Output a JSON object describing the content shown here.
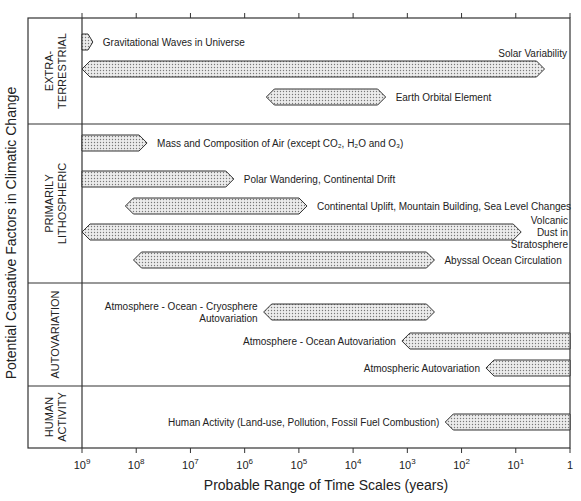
{
  "chart_data": {
    "type": "bar",
    "subtype": "horizontal-range",
    "title": "",
    "xlabel": "Probable Range of Time Scales (years)",
    "ylabel": "Potential Causative Factors in Climatic Change",
    "x_scale": "log",
    "x_direction": "decreasing",
    "xlim_log10": [
      9,
      0
    ],
    "x_ticks": [
      {
        "exp": 9,
        "base": "10",
        "sup": "9"
      },
      {
        "exp": 8,
        "base": "10",
        "sup": "8"
      },
      {
        "exp": 7,
        "base": "10",
        "sup": "7"
      },
      {
        "exp": 6,
        "base": "10",
        "sup": "6"
      },
      {
        "exp": 5,
        "base": "10",
        "sup": "5"
      },
      {
        "exp": 4,
        "base": "10",
        "sup": "4"
      },
      {
        "exp": 3,
        "base": "10",
        "sup": "3"
      },
      {
        "exp": 2,
        "base": "10",
        "sup": "2"
      },
      {
        "exp": 1,
        "base": "10",
        "sup": "1"
      },
      {
        "exp": 0,
        "base": "1",
        "sup": ""
      }
    ],
    "groups": [
      {
        "name": "EXTRA-TERRESTRIAL",
        "label_lines": [
          "EXTRA-",
          "TERRESTRIAL"
        ],
        "rows": 3,
        "factors": [
          {
            "name": "Gravitational Waves in Universe",
            "label_lines": [
              "Gravitational Waves in Universe"
            ],
            "from_log10": 9.0,
            "to_log10": 8.8,
            "label_side": "right"
          },
          {
            "name": "Solar Variability",
            "label_lines": [
              "Solar Variability"
            ],
            "from_log10": 9.0,
            "to_log10": 0.47,
            "label_side": "above-right"
          },
          {
            "name": "Earth Orbital Element",
            "label_lines": [
              "Earth Orbital Element"
            ],
            "from_log10": 5.6,
            "to_log10": 3.4,
            "label_side": "right"
          }
        ]
      },
      {
        "name": "PRIMARILY LITHOSPHERIC",
        "label_lines": [
          "PRIMARILY",
          "LITHOSPHERIC"
        ],
        "rows": 5,
        "factors": [
          {
            "name": "Mass and Composition of Air (except CO2, H2O and O3)",
            "label_lines": [
              "Mass and Composition of Air (except CO₂, H₂O and O₃)"
            ],
            "from_log10": 9.0,
            "to_log10": 7.8,
            "label_side": "right"
          },
          {
            "name": "Polar Wandering, Continental Drift",
            "label_lines": [
              "Polar Wandering, Continental Drift"
            ],
            "from_log10": 9.0,
            "to_log10": 6.2,
            "label_side": "right"
          },
          {
            "name": "Continental Uplift, Mountain Building, Sea Level Changes",
            "label_lines": [
              "Continental Uplift, Mountain Building, Sea Level Changes"
            ],
            "from_log10": 8.2,
            "to_log10": 4.85,
            "label_side": "right"
          },
          {
            "name": "Volcanic Dust in Stratosphere",
            "label_lines": [
              "Volcanic",
              "Dust in",
              "Stratosphere"
            ],
            "from_log10": 9.0,
            "to_log10": 0.9,
            "label_side": "right-edge"
          },
          {
            "name": "Abyssal Ocean Circulation",
            "label_lines": [
              "Abyssal Ocean Circulation"
            ],
            "from_log10": 8.05,
            "to_log10": 2.5,
            "label_side": "right"
          }
        ]
      },
      {
        "name": "AUTOVARIATION",
        "label_lines": [
          "AUTOVARIATION"
        ],
        "rows": 3,
        "factors": [
          {
            "name": "Atmosphere - Ocean - Cryosphere Autovariation",
            "label_lines": [
              "Atmosphere - Ocean - Cryosphere",
              "Autovariation"
            ],
            "from_log10": 5.65,
            "to_log10": 2.5,
            "label_side": "left"
          },
          {
            "name": "Atmosphere - Ocean Autovariation",
            "label_lines": [
              "Atmosphere - Ocean Autovariation"
            ],
            "from_log10": 3.1,
            "to_log10": 0.0,
            "label_side": "left"
          },
          {
            "name": "Atmospheric Autovariation",
            "label_lines": [
              "Atmospheric Autovariation"
            ],
            "from_log10": 1.55,
            "to_log10": 0.0,
            "label_side": "left"
          }
        ]
      },
      {
        "name": "HUMAN ACTIVITY",
        "label_lines": [
          "HUMAN",
          "ACTIVITY"
        ],
        "rows": 1,
        "factors": [
          {
            "name": "Human Activity (Land-use, Pollution, Fossil Fuel Combustion)",
            "label_lines": [
              "Human Activity (Land-use, Pollution, Fossil Fuel Combustion)"
            ],
            "from_log10": 2.3,
            "to_log10": 0.0,
            "label_side": "left"
          }
        ]
      }
    ],
    "colors": {
      "bar_fill": "#e4e4e4",
      "bar_stroke": "#333333",
      "frame": "#333333",
      "text": "#222222"
    },
    "grid": false,
    "legend": "none"
  }
}
